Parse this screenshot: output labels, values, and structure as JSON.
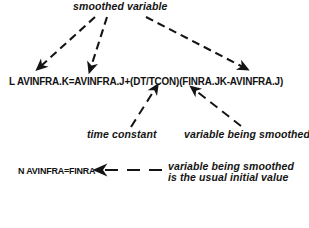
{
  "diagram": {
    "title_label": "smoothed variable",
    "equation_level": "L  AVINFRA.K=AVINFRA.J+(DT/TCON)(FINRA.JK-AVINFRA.J)",
    "label_time_constant": "time constant",
    "label_variable_smoothed": "variable being smoothed",
    "equation_initial": "N AVINFRA=FINRA",
    "note_initial_line1": "variable being smoothed",
    "note_initial_line2": "is the usual initial value",
    "ink_color": "#141414",
    "background_color": "#ffffff"
  }
}
